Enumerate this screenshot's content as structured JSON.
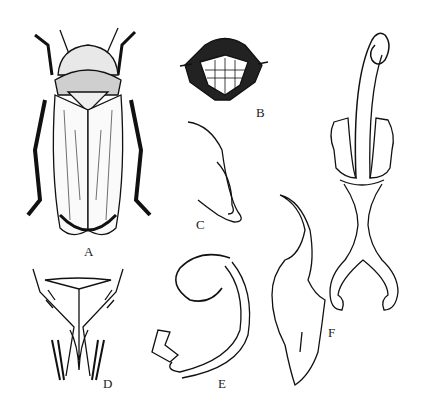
{
  "figure": {
    "panels": [
      {
        "id": "A",
        "label": "A",
        "description": "Dorsal view of leafhopper adult"
      },
      {
        "id": "B",
        "label": "B",
        "description": "Face (frontal view of head)"
      },
      {
        "id": "C",
        "label": "C",
        "description": "Style / genital appendage"
      },
      {
        "id": "D",
        "label": "D",
        "description": "Pygofer / genital plate (ventral view)"
      },
      {
        "id": "E",
        "label": "E",
        "description": "Curled appendage (lateral view)"
      },
      {
        "id": "F",
        "label": "F",
        "description": "Aedeagus and connective"
      }
    ],
    "colors": {
      "ink": "#111111",
      "paper": "#ffffff",
      "stipple": "#555555"
    }
  }
}
